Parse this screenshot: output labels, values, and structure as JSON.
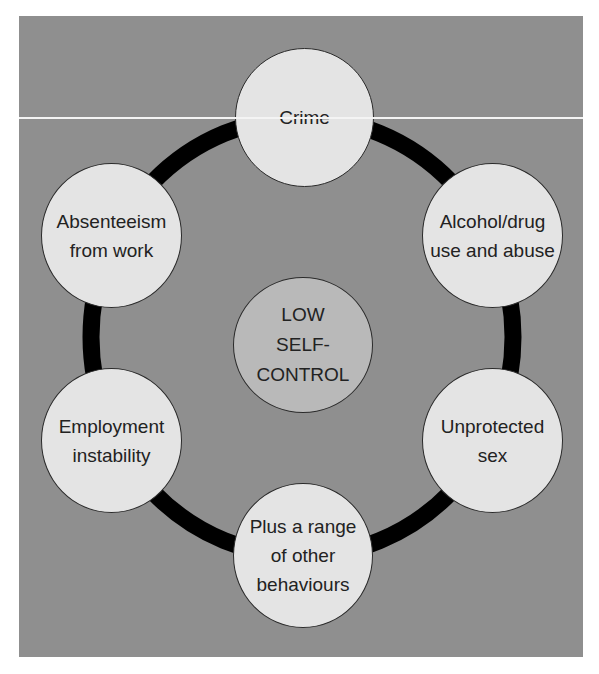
{
  "diagram": {
    "center": {
      "label": "LOW\nSELF-\nCONTROL"
    },
    "nodes": [
      {
        "id": "crime",
        "label": "Crime"
      },
      {
        "id": "alcohol",
        "label": "Alcohol/drug\nuse and abuse"
      },
      {
        "id": "unprotected",
        "label": "Unprotected\nsex"
      },
      {
        "id": "other",
        "label": "Plus a range\nof other\nbehaviours"
      },
      {
        "id": "employment",
        "label": "Employment\ninstability"
      },
      {
        "id": "absenteeism",
        "label": "Absenteeism\nfrom work"
      }
    ],
    "colors": {
      "background": "#8f8f8f",
      "node_fill": "#e4e4e4",
      "center_fill": "#b9b9b9",
      "ring": "#000000"
    }
  }
}
